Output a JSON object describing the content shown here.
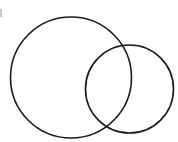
{
  "diagram": {
    "type": "venn",
    "stroke_color": "#1a1a1a",
    "stroke_width": 1.6,
    "background": "#ffffff",
    "circles": [
      {
        "name": "large-circle",
        "cx": 71,
        "cy": 77.5,
        "r": 60.5
      },
      {
        "name": "small-circle",
        "cx": 129.5,
        "cy": 89,
        "r": 44
      }
    ]
  }
}
